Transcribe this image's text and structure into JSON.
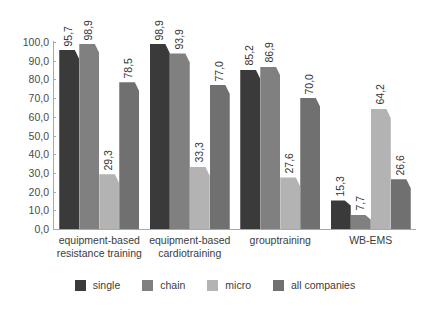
{
  "chart_data": {
    "type": "bar",
    "title": "",
    "subtitle": "",
    "xlabel": "",
    "ylabel": "",
    "ylim": [
      0,
      100
    ],
    "grid": false,
    "legend_position": "bottom",
    "orientation": "vertical",
    "grouping": "clustered",
    "value_label_rotation": 90,
    "decimal_separator": ",",
    "categories": [
      "equipment-based resistance training",
      "equipment-based cardiotraining",
      "grouptraining",
      "WB-EMS"
    ],
    "category_lines": [
      [
        "equipment-based",
        "resistance training"
      ],
      [
        "equipment-based",
        "cardiotraining"
      ],
      [
        "grouptraining"
      ],
      [
        "WB-EMS"
      ]
    ],
    "series": [
      {
        "name": "single",
        "color": "#3a3a3a",
        "values": [
          95.7,
          98.9,
          85.2,
          15.3
        ],
        "labels": [
          "95,7",
          "98,9",
          "85,2",
          "15,3"
        ]
      },
      {
        "name": "chain",
        "color": "#808080",
        "values": [
          98.9,
          93.9,
          86.9,
          7.7
        ],
        "labels": [
          "98,9",
          "93,9",
          "86,9",
          "7,7"
        ]
      },
      {
        "name": "micro",
        "color": "#b3b3b3",
        "values": [
          29.3,
          33.3,
          27.6,
          64.2
        ],
        "labels": [
          "29,3",
          "33,3",
          "27,6",
          "64,2"
        ]
      },
      {
        "name": "all companies",
        "color": "#707070",
        "values": [
          78.5,
          77.0,
          70.0,
          26.6
        ],
        "labels": [
          "78,5",
          "77,0",
          "70,0",
          "26,6"
        ]
      }
    ],
    "yticks": [
      0,
      10,
      20,
      30,
      40,
      50,
      60,
      70,
      80,
      90,
      100
    ],
    "ytick_labels": [
      "0,0",
      "10,0",
      "20,0",
      "30,0",
      "40,0",
      "50,0",
      "60,0",
      "70,0",
      "80,0",
      "90,0",
      "100,0"
    ]
  },
  "colors": {
    "axis": "#a8a8a8",
    "text": "#3c3c3c",
    "tick_text": "#4a4a4a",
    "background": "#ffffff"
  }
}
